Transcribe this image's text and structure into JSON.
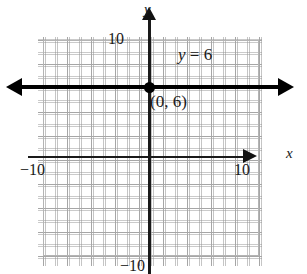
{
  "figure": {
    "kind": "coordinate-plane-graph",
    "background_color": "#ffffff"
  },
  "axes": {
    "x_axis_name": "x",
    "y_axis_name": "y",
    "x_min_label": "−10",
    "x_max_label": "10",
    "y_max_label": "10",
    "y_min_label": "−10",
    "axis_color": "#1a1a1a"
  },
  "grid": {
    "major_line_color": "#a6a6a6",
    "minor_line_color": "#969696",
    "major_step_units": 2,
    "minor_step_units": 1
  },
  "plot": {
    "equation_label": "y = 6",
    "equation_variable": "y",
    "equation_rest": " = 6",
    "point_label": "(0, 6)",
    "line_color": "#000000",
    "point_color": "#000000"
  },
  "chart_data": {
    "type": "line",
    "title": "",
    "xlabel": "x",
    "ylabel": "y",
    "xlim": [
      -10,
      10
    ],
    "ylim": [
      -10,
      10
    ],
    "grid": true,
    "legend": "none",
    "series": [
      {
        "name": "y = 6",
        "equation": "y = 6",
        "slope": 0,
        "intercept": 6,
        "x": [
          -10,
          10
        ],
        "values": [
          6,
          6
        ],
        "style": "solid-bold-double-arrow",
        "color": "#000000"
      }
    ],
    "annotations": [
      {
        "text": "y = 6",
        "x": 4,
        "y": 8.5
      },
      {
        "text": "(0, 6)",
        "x": 0.6,
        "y": 5.2
      }
    ],
    "points": [
      {
        "label": "(0, 6)",
        "x": 0,
        "y": 6
      }
    ],
    "x_ticks": [
      -10,
      10
    ],
    "y_ticks": [
      -10,
      10
    ],
    "x_tick_labels": [
      "−10",
      "10"
    ],
    "y_tick_labels": [
      "−10",
      "10"
    ]
  }
}
